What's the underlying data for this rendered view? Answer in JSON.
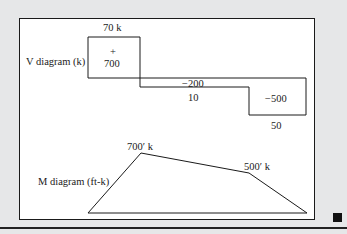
{
  "v_diagram": {
    "title": "V diagram (k)",
    "labels": {
      "top_value": "70 k",
      "plus_sign": "+",
      "left_area": "700",
      "mid_value": "−200",
      "mid_area": "10",
      "right_area": "−500",
      "right_value": "50"
    }
  },
  "m_diagram": {
    "title": "M diagram (ft-k)",
    "labels": {
      "peak_left": "700′ k",
      "peak_right": "500′ k"
    }
  },
  "colors": {
    "background": "#e6e7e8",
    "panel": "#ffffff",
    "line": "#1a1a1a"
  }
}
